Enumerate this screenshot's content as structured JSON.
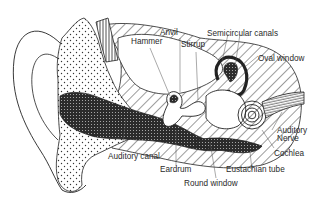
{
  "diagram": {
    "labels": {
      "hammer": "Hammer",
      "anvil": "Anvil",
      "stirrup": "Stirrup",
      "semicircular_canals": "Semicircular canals",
      "oval_window": "Oval window",
      "auditory_nerve_line1": "Auditory",
      "auditory_nerve_line2": "Nerve",
      "cochlea": "Cochlea",
      "eustachian_tube": "Eustachian tube",
      "round_window": "Round window",
      "eardrum": "Eardrum",
      "auditory_canal": "Auditory canal"
    },
    "colors": {
      "line": "#1a1a1a",
      "background": "#ffffff",
      "dark_fill": "#2b2b2b",
      "label_text": "#2a2a2a"
    }
  }
}
